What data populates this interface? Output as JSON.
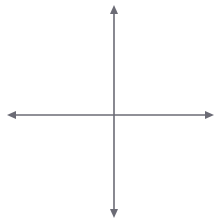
{
  "figure": {
    "kind": "coordinate-plane-transformation",
    "background": "#ffffff",
    "grid_color": "#c9c9d4",
    "axis_color": "#6b6b75",
    "shape_color": "#2b2b2b"
  },
  "axes": {
    "x_label": "x",
    "y_label": "y",
    "origin_px": [
      114,
      115
    ],
    "unit_px": 19.2,
    "x_range": [
      -5,
      5
    ],
    "y_range": [
      -5,
      5
    ],
    "show_tick_numbers": false,
    "grid": true
  },
  "chart_data": {
    "type": "scatter",
    "title": "",
    "xlabel": "x",
    "ylabel": "y",
    "xlim": [
      -5,
      5
    ],
    "ylim": [
      -5,
      5
    ],
    "grid": true,
    "series": [
      {
        "name": "Triangle IJK",
        "closed": true,
        "points": [
          {
            "label": "I",
            "x": 4.1,
            "y": -4.8,
            "label_dx": -1,
            "label_dy": 10
          },
          {
            "label": "J",
            "x": 4.8,
            "y": 0.7,
            "label_dx": 5,
            "label_dy": 5
          },
          {
            "label": "K",
            "x": 2.9,
            "y": -3.0,
            "label_dx": -12,
            "label_dy": 2
          }
        ]
      },
      {
        "name": "Triangle I'J'K'",
        "closed": true,
        "points": [
          {
            "label": "I'",
            "x": -0.9,
            "y": 0.0,
            "label_dx": -1,
            "label_dy": 9
          },
          {
            "label": "J'",
            "x": 0.0,
            "y": 4.1,
            "label_dx": 4,
            "label_dy": 3
          },
          {
            "label": "K'",
            "x": -2.0,
            "y": 1.9,
            "label_dx": -14,
            "label_dy": 0
          }
        ]
      }
    ]
  },
  "labels": {
    "I": "I",
    "J": "J",
    "K": "K",
    "I_prime": "I'",
    "J_prime": "J'",
    "K_prime": "K'"
  }
}
